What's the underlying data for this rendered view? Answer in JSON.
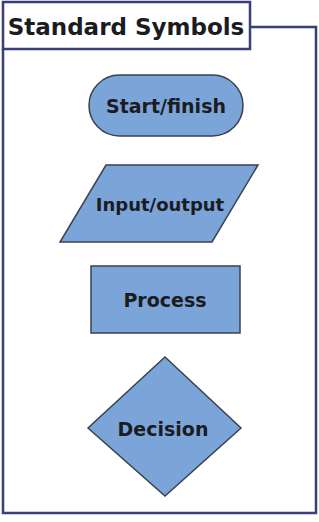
{
  "title": "Standard Symbols",
  "colors": {
    "frame": "#3a3f7a",
    "shape_fill": "#7ba4d9",
    "shape_stroke": "#3a4250",
    "text": "#1b1b22",
    "background": "#ffffff"
  },
  "symbols": [
    {
      "shape": "stadium",
      "label": "Start/finish"
    },
    {
      "shape": "parallelogram",
      "label": "Input/output"
    },
    {
      "shape": "rectangle",
      "label": "Process"
    },
    {
      "shape": "diamond",
      "label": "Decision"
    }
  ]
}
